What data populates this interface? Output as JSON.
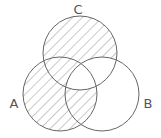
{
  "diagram": {
    "type": "venn",
    "sets": [
      {
        "label": "A",
        "cx": 60,
        "cy": 94,
        "r": 37,
        "label_x": 14,
        "label_y": 108
      },
      {
        "label": "B",
        "cx": 102,
        "cy": 94,
        "r": 37,
        "label_x": 148,
        "label_y": 108
      },
      {
        "label": "C",
        "cx": 80,
        "cy": 53,
        "r": 37,
        "label_x": 78,
        "label_y": 14
      }
    ],
    "shaded_regions": [
      "A only",
      "C only",
      "A∩C only",
      "A∩B only"
    ],
    "unshaded_regions": [
      "B only",
      "B∩C only",
      "A∩B∩C"
    ],
    "stroke_color": "#666666",
    "hatch_color": "#888888"
  }
}
